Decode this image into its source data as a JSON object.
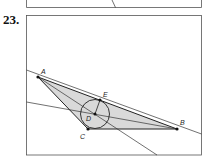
{
  "problem": {
    "number": "23."
  },
  "figure": {
    "points": {
      "A": {
        "label": "A",
        "x": 38,
        "y": 77
      },
      "B": {
        "label": "B",
        "x": 177,
        "y": 129
      },
      "C": {
        "label": "C",
        "x": 88,
        "y": 129
      },
      "D": {
        "label": "D",
        "x": 95,
        "y": 114
      },
      "E": {
        "label": "E",
        "x": 100,
        "y": 100
      }
    },
    "circle": {
      "center": "D",
      "radius": 14
    },
    "colors": {
      "triangle_fill": "#d9d9d9",
      "stroke": "#222222",
      "frame": "#555555"
    }
  }
}
